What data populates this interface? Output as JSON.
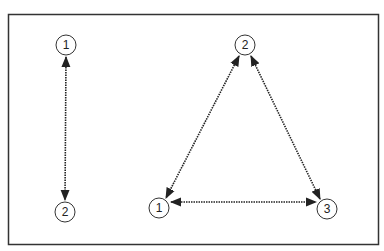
{
  "diagram": {
    "frame": {
      "x": 8,
      "y": 14,
      "width": 370,
      "height": 230,
      "stroke": "#333333"
    },
    "colors": {
      "line": "#222222",
      "node_stroke": "#333333",
      "node_fill": "#ffffff",
      "text": "#222222"
    },
    "node_radius": 10,
    "graphs": [
      {
        "name": "two-node-graph",
        "nodes": [
          {
            "id": "g1n1",
            "label": "1",
            "x": 66,
            "y": 45
          },
          {
            "id": "g1n2",
            "label": "2",
            "x": 65,
            "y": 212
          }
        ],
        "edges": [
          {
            "from": "g1n1",
            "to": "g1n2",
            "style": "dotted",
            "arrows": "both"
          }
        ]
      },
      {
        "name": "triangle-graph",
        "nodes": [
          {
            "id": "g2n2",
            "label": "2",
            "x": 245,
            "y": 45
          },
          {
            "id": "g2n1",
            "label": "1",
            "x": 159,
            "y": 208
          },
          {
            "id": "g2n3",
            "label": "3",
            "x": 327,
            "y": 209
          }
        ],
        "edges": [
          {
            "from": "g2n2",
            "to": "g2n1",
            "style": "dotted",
            "arrows": "both"
          },
          {
            "from": "g2n2",
            "to": "g2n3",
            "style": "dotted",
            "arrows": "both"
          },
          {
            "from": "g2n1",
            "to": "g2n3",
            "style": "dotted",
            "arrows": "both"
          }
        ]
      }
    ]
  },
  "labels": {
    "left_top": "1",
    "left_bottom": "2",
    "tri_top": "2",
    "tri_left": "1",
    "tri_right": "3"
  }
}
